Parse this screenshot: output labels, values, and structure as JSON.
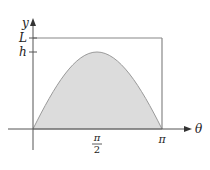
{
  "diagram": {
    "type": "area-under-curve",
    "axes": {
      "x_label": "θ",
      "y_label": "y"
    },
    "y_ticks": [
      {
        "label": "L"
      },
      {
        "label": "h"
      }
    ],
    "x_ticks": [
      {
        "label_num": "π",
        "label_den": "2"
      },
      {
        "label": "π"
      }
    ],
    "colors": {
      "fill": "#dcdcdc",
      "curve": "#999999",
      "axis": "#555555",
      "rect": "#888888"
    }
  }
}
